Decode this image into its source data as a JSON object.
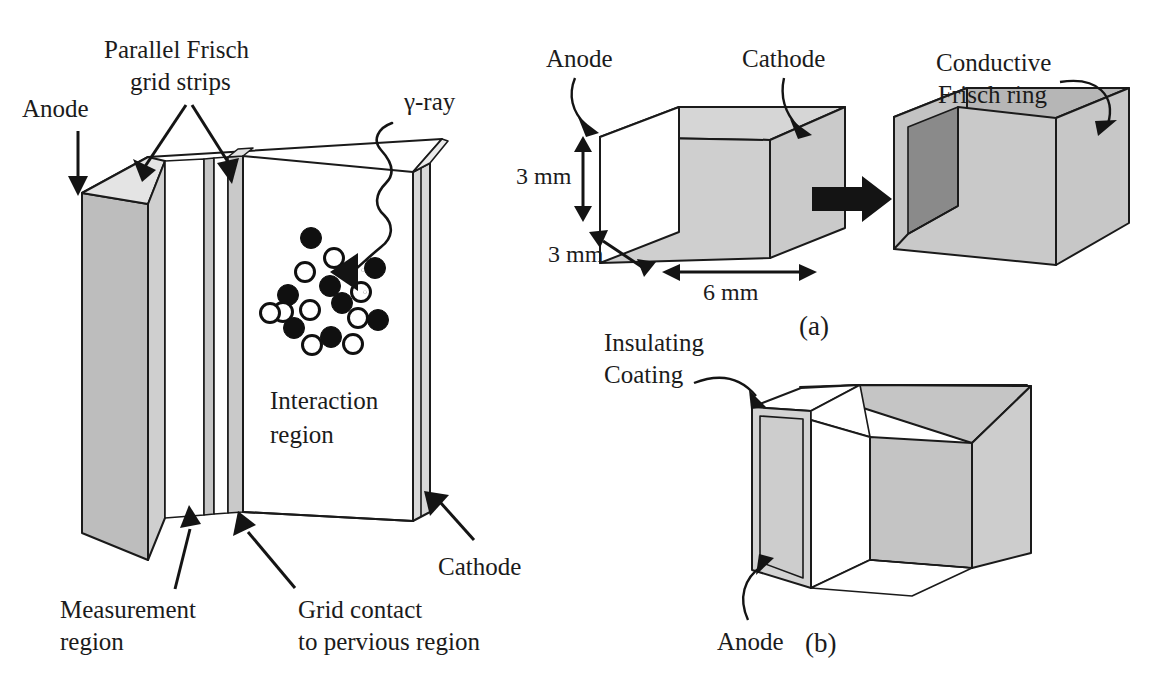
{
  "figure": {
    "background": "#ffffff",
    "ink": "#141414"
  },
  "palette": {
    "ink": "#141414",
    "face_light": "#d2d2d2",
    "face_mid": "#bdbdbd",
    "face_dark": "#8d8d8d",
    "face_darker": "#787878",
    "white": "#ffffff",
    "outline": "#1a1a1a"
  },
  "main_panel": {
    "labels": {
      "anode": "Anode",
      "grid_strips_line1": "Parallel Frisch",
      "grid_strips_line2": "grid strips",
      "gamma_ray": "γ-ray",
      "interaction_line1": "Interaction",
      "interaction_line2": "region",
      "measurement_line1": "Measurement",
      "measurement_line2": "region",
      "grid_contact_line1": "Grid contact",
      "grid_contact_line2": "to pervious region",
      "cathode": "Cathode"
    },
    "charge_cloud": {
      "filled_label": "electron",
      "open_label": "hole",
      "filled_count": 9,
      "open_count": 10
    }
  },
  "panel_a": {
    "caption": "(a)",
    "labels": {
      "anode": "Anode",
      "cathode": "Cathode",
      "frisch_ring_line1": "Conductive",
      "frisch_ring_line2": "Frisch ring"
    },
    "dimensions": {
      "height": "3 mm",
      "depth": "3 mm",
      "width": "6 mm"
    }
  },
  "panel_b": {
    "caption": "(b)",
    "labels": {
      "insulating_line1": "Insulating",
      "insulating_line2": "Coating",
      "anode": "Anode"
    }
  },
  "icons": {
    "arrow_head": "triangle-arrow-head-icon",
    "squiggle": "wavy-gamma-ray-icon",
    "transform_arrow": "thick-right-arrow-icon"
  }
}
